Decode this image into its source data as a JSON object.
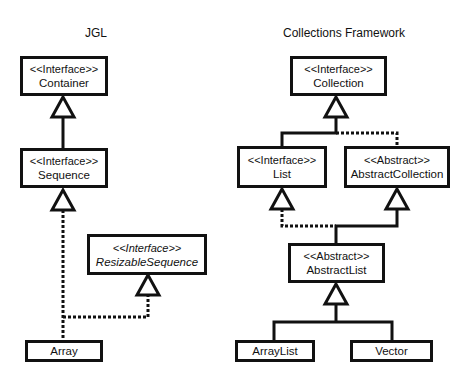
{
  "titles": {
    "left": "JGL",
    "right": "Collections Framework"
  },
  "nodes": {
    "container": {
      "stereotype": "<<Interface>>",
      "name": "Container"
    },
    "sequence": {
      "stereotype": "<<Interface>>",
      "name": "Sequence"
    },
    "resizable_sequence": {
      "stereotype": "<<Interface>>",
      "name": "ResizableSequence"
    },
    "array": {
      "name": "Array"
    },
    "collection": {
      "stereotype": "<<Interface>>",
      "name": "Collection"
    },
    "list": {
      "stereotype": "<<Interface>>",
      "name": "List"
    },
    "abstract_collection": {
      "stereotype": "<<Abstract>>",
      "name": "AbstractCollection"
    },
    "abstract_list": {
      "stereotype": "<<Abstract>>",
      "name": "AbstractList"
    },
    "array_list": {
      "name": "ArrayList"
    },
    "vector": {
      "name": "Vector"
    }
  },
  "edges": [
    {
      "from": "Sequence",
      "to": "Container",
      "type": "generalization"
    },
    {
      "from": "Array",
      "to": "Sequence",
      "type": "realization"
    },
    {
      "from": "Array",
      "to": "ResizableSequence",
      "type": "realization"
    },
    {
      "from": "List",
      "to": "Collection",
      "type": "generalization"
    },
    {
      "from": "AbstractCollection",
      "to": "Collection",
      "type": "realization"
    },
    {
      "from": "AbstractList",
      "to": "List",
      "type": "realization"
    },
    {
      "from": "AbstractList",
      "to": "AbstractCollection",
      "type": "generalization"
    },
    {
      "from": "ArrayList",
      "to": "AbstractList",
      "type": "generalization"
    },
    {
      "from": "Vector",
      "to": "AbstractList",
      "type": "generalization"
    }
  ]
}
